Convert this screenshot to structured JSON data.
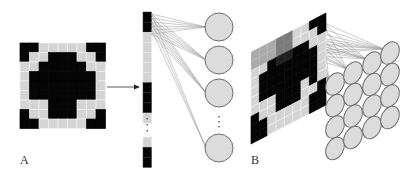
{
  "figure": {
    "panels": [
      {
        "id": "A",
        "label": "A"
      },
      {
        "id": "B",
        "label": "B"
      }
    ],
    "colors": {
      "black": "#050505",
      "gray_cell": "#d4d4d4",
      "grid_line": "#8c8c8c",
      "neuron_fill": "#dcdcdc",
      "neuron_stroke": "#6e6e6e",
      "connection": "#9a9a9a",
      "highlight": "#555555"
    },
    "panel_a": {
      "input_image_rows": [
        "BBGGGGGBB",
        "BGGBBBGGB",
        "GGBBBBBGG",
        "GBBBBBBBG",
        "GBBBBBBBG",
        "GBBBBBBBG",
        "GGGBBBGGG",
        "BGGBBBGGB",
        "BBGGGGGBB"
      ],
      "flatten_arrow": "right-arrow",
      "vector_segments": [
        "B",
        "B",
        "G",
        "G",
        "G",
        "G",
        "G",
        "B",
        "B",
        "B",
        "G",
        "dots",
        "G",
        "B",
        "B"
      ],
      "vector_ellipsis": "⋮",
      "neurons_visible": 4,
      "neuron_ellipsis": "⋮"
    },
    "panel_b": {
      "grid_rows": [
        "GGGGGGGBB",
        "GGGGGGGGB",
        "GGBBBBBGG",
        "GBBBBBBBG",
        "GBBBBBBBG",
        "GBBBBBBBG",
        "GGGBBBGBG",
        "BGGBBBGGB",
        "BBGGGGGBB",
        "BBGGGGGBB"
      ],
      "neuron_grid": {
        "cols": 4,
        "rows": 4
      }
    }
  }
}
